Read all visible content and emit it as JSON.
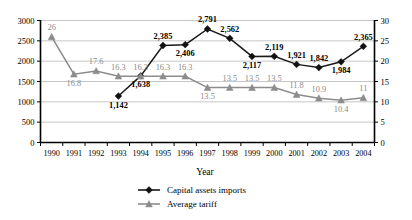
{
  "chart_data": {
    "type": "line",
    "title": "",
    "xlabel": "Year",
    "ylabel": "",
    "grid": true,
    "legend_position": "bottom",
    "categories": [
      "1990",
      "1991",
      "1992",
      "1993",
      "1994",
      "1995",
      "1996",
      "1997",
      "1998",
      "1999",
      "2000",
      "2001",
      "2002",
      "2003",
      "2004"
    ],
    "axes": {
      "left": {
        "ylim": [
          0,
          3000
        ],
        "ticks": [
          0,
          500,
          1000,
          1500,
          2000,
          2500,
          3000
        ],
        "tick_labels": [
          "0",
          "500",
          "1000",
          "1500",
          "2000",
          "2500",
          "3000"
        ]
      },
      "right": {
        "ylim": [
          0,
          30
        ],
        "ticks": [
          0,
          5,
          10,
          15,
          20,
          25,
          30
        ],
        "tick_labels": [
          "0",
          "5",
          "10",
          "15",
          "20",
          "25",
          "30"
        ]
      }
    },
    "series": [
      {
        "name": "Capital assets imports",
        "axis": "left",
        "marker": "diamond",
        "color": "#111111",
        "values": [
          null,
          null,
          null,
          1142,
          1638,
          2385,
          2406,
          2791,
          2562,
          2117,
          2119,
          1921,
          1842,
          1984,
          2365
        ],
        "data_labels": [
          "",
          "",
          "",
          "1,142",
          "1,638",
          "2,385",
          "2,406",
          "2,791",
          "2,562",
          "2,117",
          "2,119",
          "1,921",
          "1,842",
          "1,984",
          "2,365"
        ],
        "label_positions": [
          "",
          "",
          "",
          "below",
          "below",
          "above",
          "below",
          "above",
          "above",
          "below",
          "above",
          "above",
          "above",
          "below",
          "above"
        ]
      },
      {
        "name": "Average tariff",
        "axis": "right",
        "marker": "triangle",
        "color": "#8c8c8c",
        "values": [
          26,
          16.8,
          17.6,
          16.3,
          16.3,
          16.3,
          16.3,
          13.5,
          13.5,
          13.5,
          13.5,
          11.8,
          10.9,
          10.4,
          11
        ],
        "data_labels": [
          "26",
          "16.8",
          "17.6",
          "16.3",
          "16.3",
          "16.3",
          "16.3",
          "13.5",
          "13.5",
          "13.5",
          "13.5",
          "11.8",
          "10.9",
          "10.4",
          "11"
        ],
        "label_positions": [
          "above",
          "below",
          "above",
          "above",
          "above",
          "above",
          "above",
          "below",
          "above",
          "above",
          "above",
          "above",
          "above",
          "below",
          "above"
        ]
      }
    ]
  },
  "legend": {
    "items": [
      {
        "label": "Capital assets imports",
        "marker": "diamond-icon"
      },
      {
        "label": "Average tariff",
        "marker": "triangle-icon"
      }
    ]
  }
}
